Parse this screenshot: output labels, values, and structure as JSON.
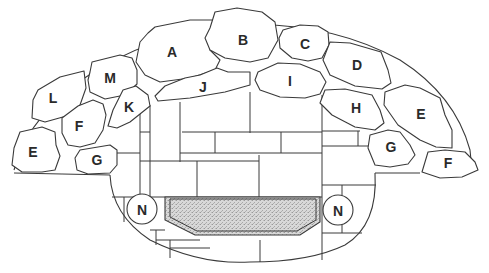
{
  "diagram": {
    "type": "stone-patio-layout",
    "colors": {
      "line": "#3a3a3a",
      "fill": "#ffffff",
      "hearth": "#cfcfcf"
    },
    "stones": [
      {
        "id": "A",
        "label": "A",
        "x": 172,
        "y": 52
      },
      {
        "id": "B",
        "label": "B",
        "x": 243,
        "y": 40
      },
      {
        "id": "C",
        "label": "C",
        "x": 305,
        "y": 44
      },
      {
        "id": "D",
        "label": "D",
        "x": 357,
        "y": 65
      },
      {
        "id": "E-right",
        "label": "E",
        "x": 421,
        "y": 114
      },
      {
        "id": "F-right",
        "label": "F",
        "x": 448,
        "y": 163
      },
      {
        "id": "G-right",
        "label": "G",
        "x": 391,
        "y": 147
      },
      {
        "id": "H",
        "label": "H",
        "x": 356,
        "y": 108
      },
      {
        "id": "I",
        "label": "I",
        "x": 290,
        "y": 81
      },
      {
        "id": "J",
        "label": "J",
        "x": 203,
        "y": 87
      },
      {
        "id": "K",
        "label": "K",
        "x": 129,
        "y": 107
      },
      {
        "id": "M",
        "label": "M",
        "x": 110,
        "y": 78
      },
      {
        "id": "L",
        "label": "L",
        "x": 53,
        "y": 98
      },
      {
        "id": "F-left",
        "label": "F",
        "x": 79,
        "y": 126
      },
      {
        "id": "E-left",
        "label": "E",
        "x": 33,
        "y": 152
      },
      {
        "id": "G-left",
        "label": "G",
        "x": 97,
        "y": 160
      }
    ],
    "fixtures": [
      {
        "id": "N-left",
        "label": "N",
        "x": 142,
        "y": 209
      },
      {
        "id": "N-right",
        "label": "N",
        "x": 338,
        "y": 210
      }
    ]
  }
}
